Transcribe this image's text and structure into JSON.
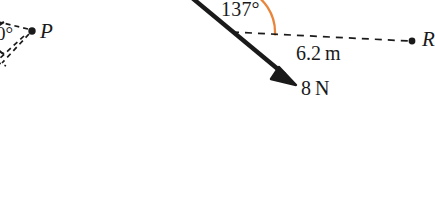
{
  "figure": {
    "type": "vector-force-diagram",
    "background_color": "#ffffff",
    "stroke_color": "#1a1a1a",
    "arc_color": "#e8853a",
    "labels": {
      "angle_main": "137°",
      "distance": "6.2 m",
      "force": "8 N",
      "point_left": "P",
      "point_right": "R",
      "angle_partial_left": "0°"
    },
    "annotations": {
      "angle_value_degrees": 137,
      "distance_value": 6.2,
      "distance_unit": "m",
      "force_value": 8,
      "force_unit": "N"
    },
    "geometry": {
      "vertex": {
        "x": 229,
        "y": 32
      },
      "force_arrow": {
        "start": {
          "x": 192,
          "y": -2
        },
        "tip": {
          "x": 296,
          "y": 85
        },
        "line_width": 4.2,
        "arrowhead_length": 24,
        "arrowhead_half_width": 9
      },
      "dashed_baseline": {
        "start": {
          "x": 232,
          "y": 32
        },
        "end": {
          "x": 412,
          "y": 41
        },
        "dash_pattern": "7 6",
        "line_width": 1.7
      },
      "angle_arc": {
        "center": {
          "x": 229,
          "y": 32
        },
        "radius": 46,
        "start_angle_deg": 3,
        "sweep_deg": -137,
        "line_width": 2.2
      },
      "point_right_dot": {
        "x": 412,
        "y": 41,
        "radius": 3.4
      },
      "point_left_dot": {
        "x": 32,
        "y": 31,
        "radius": 3.6
      },
      "left_partial_arc": {
        "center": {
          "x": -12,
          "y": 38
        },
        "radius": 18,
        "start_angle_deg": -62,
        "sweep_deg": 124
      },
      "left_dashed_rays": [
        {
          "from": {
            "x": 28,
            "y": 30
          },
          "to": {
            "x": -14,
            "y": 22
          }
        },
        {
          "from": {
            "x": 28,
            "y": 33
          },
          "to": {
            "x": -6,
            "y": 62
          }
        },
        {
          "from": {
            "x": 2,
            "y": 58
          },
          "to": {
            "x": 24,
            "y": 36
          }
        }
      ]
    }
  }
}
